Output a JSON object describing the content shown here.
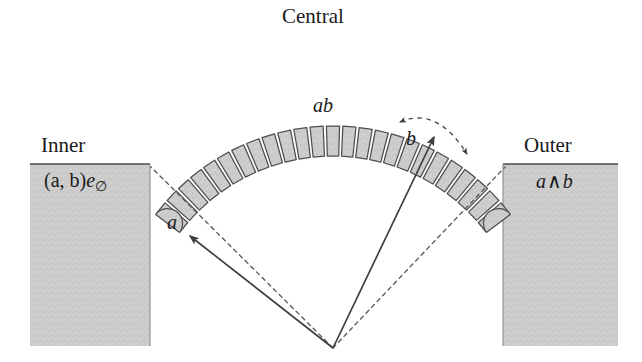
{
  "figure": {
    "width": 642,
    "height": 362,
    "background": "#ffffff"
  },
  "labels": {
    "central": "Central",
    "inner": "Inner",
    "outer": "Outer",
    "geometric_product": "ab",
    "inner_formula_main": "(a, b)",
    "inner_formula_basis": "e",
    "inner_formula_subscript": "∅",
    "outer_formula_left": "a",
    "outer_formula_op": "∧",
    "outer_formula_right": "b",
    "vector_a": "a",
    "vector_b": "b"
  },
  "colors": {
    "fill_gray": "#cccccc",
    "stroke_dark": "#4d4d4d",
    "outline": "#555555",
    "text": "#1a1a1a",
    "background": "#ffffff"
  },
  "geometry": {
    "apex": {
      "x": 333,
      "y": 348
    },
    "arc_center": {
      "x": 333,
      "y": 348
    },
    "arc_inner_radius": 192,
    "arc_outer_radius": 222,
    "arc_start_angle_deg": 217,
    "arc_end_angle_deg": 323,
    "tile_count": 25,
    "tile_gap_deg": 0.85,
    "end_cap_radius": 15,
    "inner_block": {
      "x": 30,
      "y": 164,
      "width": 120,
      "height": 182
    },
    "outer_block": {
      "x": 503,
      "y": 164,
      "width": 115,
      "height": 182
    },
    "vector_a_tip": {
      "x": 190,
      "y": 236
    },
    "vector_b_tip": {
      "x": 434,
      "y": 136
    },
    "dashed_a_end": {
      "x": 151,
      "y": 168
    },
    "dashed_b_end": {
      "x": 504,
      "y": 168
    },
    "b_arc_radius": 42,
    "b_arc_start_deg": 203,
    "b_arc_end_deg": 28
  },
  "chart_data": {
    "type": "diagram",
    "regions": [
      {
        "name": "Inner",
        "label": "(a, b)e∅",
        "position": "left",
        "fill": "#cccccc"
      },
      {
        "name": "Central",
        "label": "ab",
        "position": "top-arc",
        "fill": "#cccccc",
        "segments": 25
      },
      {
        "name": "Outer",
        "label": "a∧b",
        "position": "right",
        "fill": "#cccccc"
      }
    ],
    "vectors": [
      {
        "name": "a",
        "style": "solid-arrow",
        "from": "apex",
        "direction": "upper-left"
      },
      {
        "name": "b",
        "style": "solid-arrow",
        "from": "apex",
        "direction": "upper-right"
      }
    ],
    "annotations": [
      {
        "name": "b-sweep",
        "style": "dashed-double-arrow-arc",
        "about": "vector b tip"
      },
      {
        "name": "a-extension",
        "style": "dashed-line",
        "about": "extends a to inner block corner"
      },
      {
        "name": "b-extension",
        "style": "dashed-line",
        "about": "extends b to outer block corner"
      }
    ]
  }
}
